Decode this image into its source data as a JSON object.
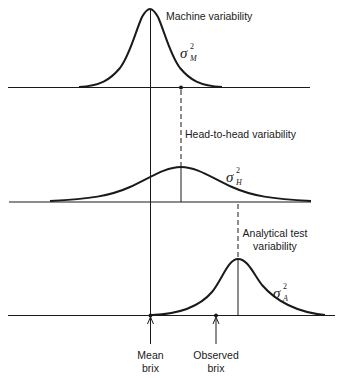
{
  "diagram": {
    "panels": [
      {
        "id": "machine",
        "label": "Machine variability",
        "sigma": {
          "symbol": "σ",
          "superscript": "2",
          "subscript": "M"
        }
      },
      {
        "id": "head",
        "label": "Head-to-head variability",
        "sigma": {
          "symbol": "σ",
          "superscript": "2",
          "subscript": "H"
        }
      },
      {
        "id": "analytical",
        "label_line1": "Analytical test",
        "label_line2": "variability",
        "sigma": {
          "symbol": "σ",
          "superscript": "2",
          "subscript": "A"
        }
      }
    ],
    "markers": {
      "mean": {
        "line1": "Mean",
        "line2": "brix"
      },
      "observed": {
        "line1": "Observed",
        "line2": "brix"
      }
    },
    "colors": {
      "ink": "#1a1a1a",
      "background": "#ffffff"
    }
  }
}
